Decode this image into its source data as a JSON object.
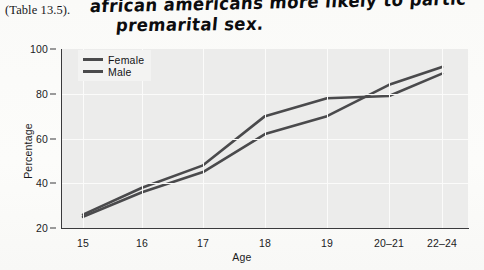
{
  "caption": {
    "text": "(Table 13.5)."
  },
  "annotation": {
    "line1": "african americans more likely to partic",
    "line2": "premarital sex."
  },
  "chart_data": {
    "type": "line",
    "title": "",
    "xlabel": "Age",
    "ylabel": "Percentage",
    "categories": [
      "15",
      "16",
      "17",
      "18",
      "19",
      "20–21",
      "22–24"
    ],
    "xticklabels": [
      "15",
      "16",
      "17",
      "18",
      "19",
      "20–21",
      "22–24"
    ],
    "yticklabels": [
      "20",
      "40",
      "60",
      "80",
      "100"
    ],
    "yticks": [
      20,
      40,
      60,
      80,
      100
    ],
    "ylim": [
      20,
      100
    ],
    "grid": true,
    "legend_position": "upper left",
    "series": [
      {
        "name": "Female",
        "color": "#4a4a4c",
        "values": [
          26,
          38,
          48,
          70,
          78,
          79,
          89
        ]
      },
      {
        "name": "Male",
        "color": "#4a4a4c",
        "values": [
          25,
          36,
          45,
          62,
          70,
          84,
          92
        ]
      }
    ]
  },
  "legend": {
    "items": [
      "Female",
      "Male"
    ]
  },
  "colors": {
    "plot_background": "#ececeb",
    "line": "#4a4a4c",
    "axis": "#3a3a3c",
    "grid": "#fbfbfa",
    "ink": "#0c0c0e"
  }
}
